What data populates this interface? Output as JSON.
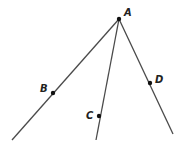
{
  "diagram": {
    "type": "rays-from-common-endpoint",
    "vertex": {
      "label": "A",
      "x": 119,
      "y": 19,
      "label_x": 124,
      "label_y": 16
    },
    "rays": [
      {
        "name": "AB",
        "from": "A",
        "to_x": 12,
        "to_y": 140,
        "point": {
          "label": "B",
          "x": 53,
          "y": 93,
          "label_x": 40,
          "label_y": 92
        }
      },
      {
        "name": "AC",
        "from": "A",
        "to_x": 96,
        "to_y": 140,
        "point": {
          "label": "C",
          "x": 99,
          "y": 116,
          "label_x": 86,
          "label_y": 119
        }
      },
      {
        "name": "AD",
        "from": "A",
        "to_x": 173,
        "to_y": 134,
        "point": {
          "label": "D",
          "x": 150,
          "y": 83,
          "label_x": 155,
          "label_y": 83
        }
      }
    ],
    "colors": {
      "line": "#4a4a4a",
      "point": "#111111",
      "label": "#222222"
    }
  }
}
